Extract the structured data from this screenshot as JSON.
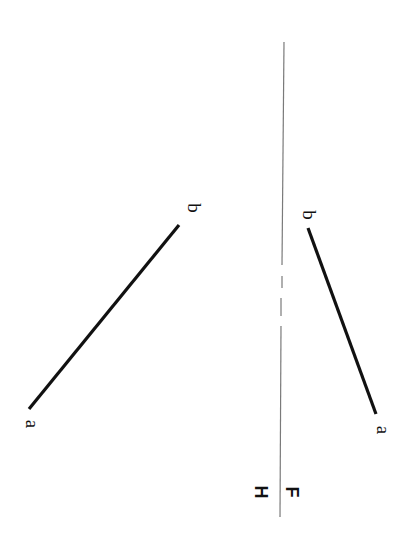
{
  "diagram": {
    "type": "orthographic-projection",
    "orientation": "rotated-90-clockwise",
    "reference_line": {
      "label_left": "H",
      "label_right": "F",
      "color": "#7a7a7a"
    },
    "top_view_line": {
      "start_label": "a",
      "end_label": "b",
      "color": "#111111"
    },
    "front_view_line": {
      "start_label": "a",
      "end_label": "b",
      "color": "#111111"
    }
  }
}
